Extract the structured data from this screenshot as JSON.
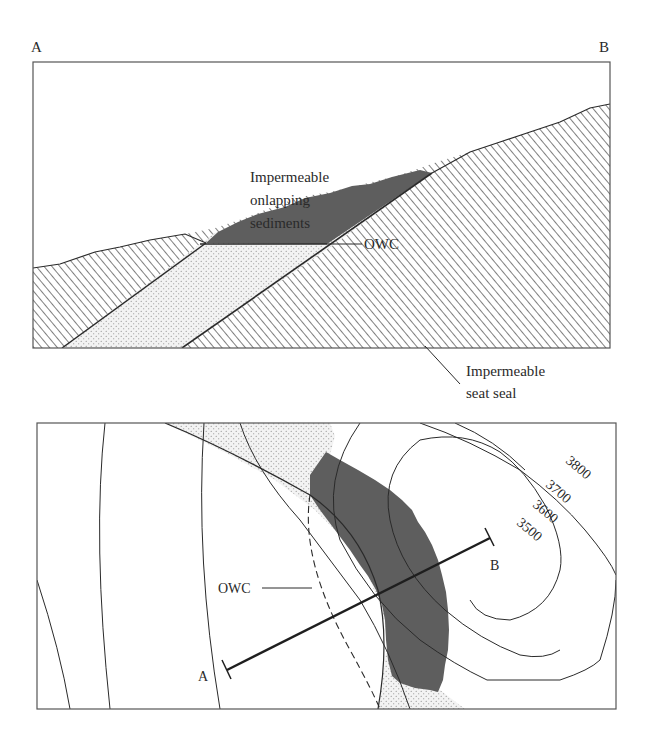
{
  "figure": {
    "cross_section": {
      "end_label_left": "A",
      "end_label_right": "B",
      "annotations": {
        "onlap_line1": "Impermeable",
        "onlap_line2": "onlapping",
        "onlap_line3": "sediments",
        "owc": "OWC",
        "seal_line1": "Impermeable",
        "seal_line2": "seat seal"
      }
    },
    "map_view": {
      "owc_label": "OWC",
      "section_end_a": "A",
      "section_end_b": "B",
      "contours": [
        {
          "label": "3800"
        },
        {
          "label": "3700"
        },
        {
          "label": "3600"
        },
        {
          "label": "3500"
        }
      ]
    },
    "colors": {
      "oil": "#5e5e5e",
      "sand_bg": "#f2f2f2",
      "sand_dot": "#8a8a8a",
      "hatch": "#3a3a3a",
      "line": "#2a2a2a"
    }
  }
}
